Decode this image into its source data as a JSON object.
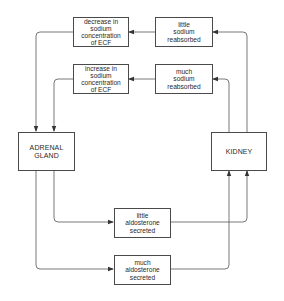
{
  "diagram": {
    "title": "",
    "nodes": {
      "decrease_sodium": {
        "label": "decrease in\nsodium\nconcentration\nof ECF"
      },
      "little_sodium": {
        "label": "little\nsodium\nreabsorbed"
      },
      "increase_sodium": {
        "label": "increase in\nsodium\nconcentration\nof ECF"
      },
      "much_sodium": {
        "label": "much\nsodium\nreabsorbed"
      },
      "adrenal": {
        "label": "ADRENAL\nGLAND"
      },
      "kidney": {
        "label": "KIDNEY"
      },
      "little_aldosterone": {
        "label": "little\naldosterone\nsecreted"
      },
      "much_aldosterone": {
        "label": "much\naldosterone\nsecreted"
      }
    },
    "edges": [
      {
        "from": "kidney",
        "to": "little_sodium"
      },
      {
        "from": "little_sodium",
        "to": "decrease_sodium"
      },
      {
        "from": "decrease_sodium",
        "to": "adrenal"
      },
      {
        "from": "kidney",
        "to": "much_sodium"
      },
      {
        "from": "much_sodium",
        "to": "increase_sodium"
      },
      {
        "from": "increase_sodium",
        "to": "adrenal"
      },
      {
        "from": "adrenal",
        "to": "little_aldosterone"
      },
      {
        "from": "little_aldosterone",
        "to": "kidney"
      },
      {
        "from": "adrenal",
        "to": "much_aldosterone"
      },
      {
        "from": "much_aldosterone",
        "to": "kidney"
      }
    ],
    "colors": {
      "line": "#4a4a4a",
      "text": "#2a2a2a",
      "background": "#ffffff"
    }
  }
}
